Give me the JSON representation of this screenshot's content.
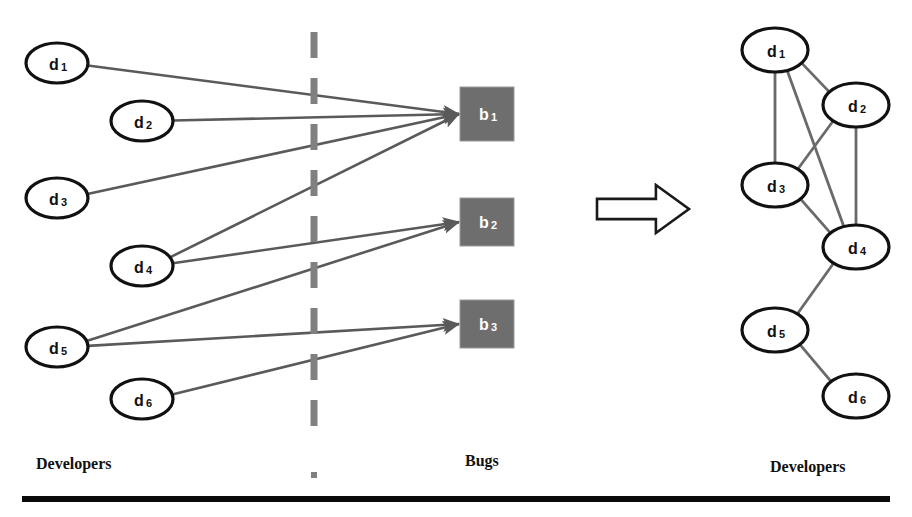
{
  "figure": {
    "width": 912,
    "height": 517,
    "background": "#ffffff"
  },
  "captions": {
    "developers_left": "Developers",
    "bugs": "Bugs",
    "developers_right": "Developers"
  },
  "colors": {
    "node_stroke": "#111111",
    "node_fill": "#ffffff",
    "bug_fill": "#6e6e6e",
    "bug_text": "#ffffff",
    "edge": "#5a5a5a",
    "collab_edge": "#6a6a6a",
    "divider": "#808080",
    "arrow_outline": "#1a1a1a",
    "baseline_rule": "#0a0a0a"
  },
  "bipartite": {
    "developers": [
      {
        "id": "d1",
        "base": "d",
        "sub": "1",
        "cx": 57,
        "cy": 63,
        "rx": 31,
        "ry": 20
      },
      {
        "id": "d2",
        "base": "d",
        "sub": "2",
        "cx": 142,
        "cy": 121,
        "rx": 31,
        "ry": 20
      },
      {
        "id": "d3",
        "base": "d",
        "sub": "3",
        "cx": 57,
        "cy": 198,
        "rx": 31,
        "ry": 20
      },
      {
        "id": "d4",
        "base": "d",
        "sub": "4",
        "cx": 142,
        "cy": 266,
        "rx": 31,
        "ry": 20
      },
      {
        "id": "d5",
        "base": "d",
        "sub": "5",
        "cx": 57,
        "cy": 347,
        "rx": 31,
        "ry": 20
      },
      {
        "id": "d6",
        "base": "d",
        "sub": "6",
        "cx": 142,
        "cy": 399,
        "rx": 31,
        "ry": 20
      }
    ],
    "bugs": [
      {
        "id": "b1",
        "base": "b",
        "sub": "1",
        "x": 460,
        "y": 87,
        "w": 54,
        "h": 54
      },
      {
        "id": "b2",
        "base": "b",
        "sub": "2",
        "x": 460,
        "y": 198,
        "w": 54,
        "h": 48
      },
      {
        "id": "b3",
        "base": "b",
        "sub": "3",
        "x": 460,
        "y": 300,
        "w": 54,
        "h": 48
      }
    ],
    "edges": [
      {
        "from": "d1",
        "to": "b1"
      },
      {
        "from": "d2",
        "to": "b1"
      },
      {
        "from": "d3",
        "to": "b1"
      },
      {
        "from": "d4",
        "to": "b1"
      },
      {
        "from": "d4",
        "to": "b2"
      },
      {
        "from": "d5",
        "to": "b2"
      },
      {
        "from": "d5",
        "to": "b3"
      },
      {
        "from": "d6",
        "to": "b3"
      }
    ]
  },
  "divider": {
    "x": 314,
    "y_top": 32,
    "y_bottom": 440,
    "dot_y": 472
  },
  "transform_arrow": {
    "x": 597,
    "y": 185,
    "width": 92,
    "height": 48
  },
  "collaboration": {
    "developers": [
      {
        "id": "d1",
        "base": "d",
        "sub": "1",
        "cx": 775,
        "cy": 50,
        "rx": 33,
        "ry": 22
      },
      {
        "id": "d2",
        "base": "d",
        "sub": "2",
        "cx": 856,
        "cy": 105,
        "rx": 33,
        "ry": 22
      },
      {
        "id": "d3",
        "base": "d",
        "sub": "3",
        "cx": 775,
        "cy": 185,
        "rx": 33,
        "ry": 22
      },
      {
        "id": "d4",
        "base": "d",
        "sub": "4",
        "cx": 856,
        "cy": 247,
        "rx": 33,
        "ry": 22
      },
      {
        "id": "d5",
        "base": "d",
        "sub": "5",
        "cx": 775,
        "cy": 330,
        "rx": 33,
        "ry": 22
      },
      {
        "id": "d6",
        "base": "d",
        "sub": "6",
        "cx": 856,
        "cy": 396,
        "rx": 33,
        "ry": 22
      }
    ],
    "edges": [
      {
        "from": "d1",
        "to": "d2"
      },
      {
        "from": "d1",
        "to": "d3"
      },
      {
        "from": "d1",
        "to": "d4"
      },
      {
        "from": "d2",
        "to": "d3"
      },
      {
        "from": "d2",
        "to": "d4"
      },
      {
        "from": "d3",
        "to": "d4"
      },
      {
        "from": "d4",
        "to": "d5"
      },
      {
        "from": "d5",
        "to": "d6"
      }
    ]
  }
}
